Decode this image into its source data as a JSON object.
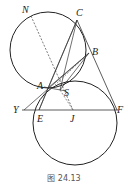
{
  "figure": {
    "caption": "图 24.13",
    "stroke_color": "#222222",
    "circles": [
      {
        "name": "upper-circle",
        "cx": 48,
        "cy": 50,
        "r": 38
      },
      {
        "name": "lower-circle",
        "cx": 75,
        "cy": 123,
        "r": 42
      }
    ],
    "points": {
      "N": {
        "x": 31,
        "y": 16,
        "label": "N",
        "lx": 22,
        "ly": 13
      },
      "C": {
        "x": 77,
        "y": 20,
        "label": "C",
        "lx": 76,
        "ly": 16
      },
      "B": {
        "x": 89,
        "y": 53,
        "label": "B",
        "lx": 92,
        "ly": 55
      },
      "A": {
        "x": 48,
        "y": 88,
        "label": "A",
        "lx": 37,
        "ly": 89
      },
      "S": {
        "x": 60,
        "y": 90,
        "label": "S",
        "lx": 64,
        "ly": 95
      },
      "Y": {
        "x": 24,
        "y": 110,
        "label": "Y",
        "lx": 13,
        "ly": 113
      },
      "E": {
        "x": 39,
        "y": 110,
        "label": "E",
        "lx": 38,
        "ly": 122
      },
      "J": {
        "x": 73,
        "y": 110,
        "label": "J",
        "lx": 70,
        "ly": 122
      },
      "F": {
        "x": 117,
        "y": 110,
        "label": "F",
        "lx": 117,
        "ly": 112
      }
    },
    "labels": [
      "N",
      "C",
      "B",
      "A",
      "S",
      "Y",
      "E",
      "J",
      "F"
    ]
  }
}
